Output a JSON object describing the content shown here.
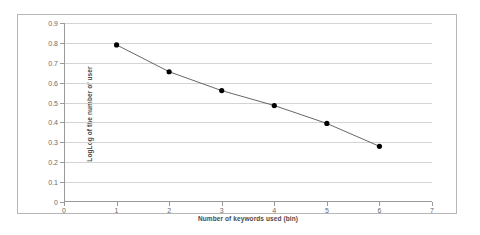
{
  "chart_data": {
    "type": "scatter",
    "title": "",
    "xlabel": "Number of keywords used (bin)",
    "ylabel": "LogLog of the number of user",
    "xlim": [
      0,
      7
    ],
    "ylim": [
      0,
      0.9
    ],
    "grid": true,
    "legend": false,
    "x_ticks": [
      "0",
      "1",
      "2",
      "3",
      "4",
      "5",
      "6",
      "7"
    ],
    "x_tick_values": [
      0,
      1,
      2,
      3,
      4,
      5,
      6,
      7
    ],
    "y_ticks": [
      "0",
      "0.1",
      "0.2",
      "0.3",
      "0.4",
      "0.5",
      "0.6",
      "0.7",
      "0.8",
      "0.9"
    ],
    "y_tick_values": [
      0,
      0.1,
      0.2,
      0.3,
      0.4,
      0.5,
      0.6,
      0.7,
      0.8,
      0.9
    ],
    "x": [
      1,
      2,
      3,
      4,
      5,
      6
    ],
    "values": [
      0.79,
      0.655,
      0.56,
      0.485,
      0.395,
      0.28
    ],
    "series": [
      {
        "name": "LogLog of the number of user",
        "x": [
          1,
          2,
          3,
          4,
          5,
          6
        ],
        "values": [
          0.79,
          0.655,
          0.56,
          0.485,
          0.395,
          0.28
        ],
        "marker": "circle",
        "marker_color": "#000000",
        "line_color": "#404040",
        "line_width": 0.8
      }
    ],
    "trendline": {
      "visible": true,
      "from": [
        1,
        0.79
      ],
      "to": [
        6,
        0.28
      ]
    },
    "colors": {
      "marker": "#000000",
      "line": "#404040",
      "grid": "#d4d4d4",
      "axis": "#9a9a9a",
      "border": "#b6b6b6",
      "tick_label": "#6b6b6b",
      "axis_title": "#4a4a4a",
      "background": "#ffffff"
    }
  }
}
